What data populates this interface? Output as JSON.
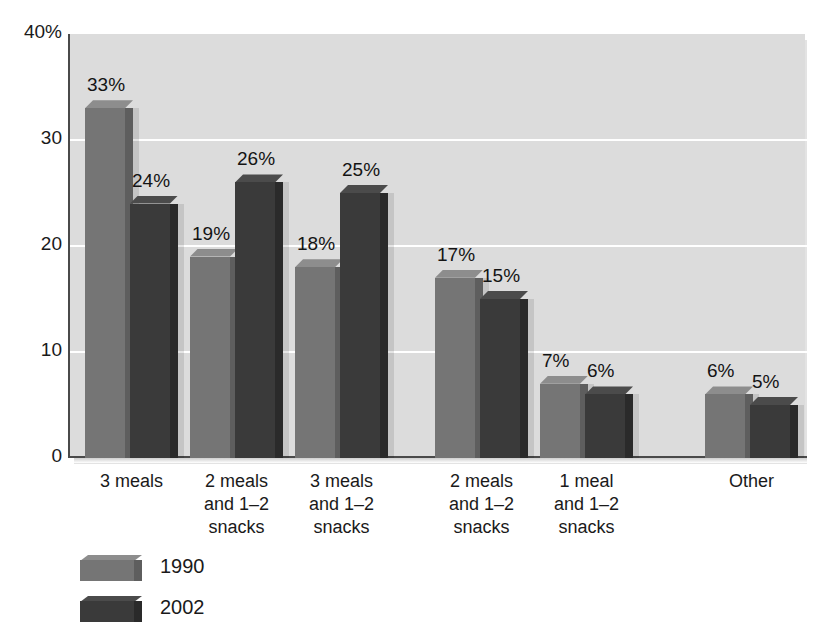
{
  "title_remnant": "",
  "chart_data": {
    "type": "bar",
    "title": "",
    "subtitle": "",
    "xlabel": "",
    "ylabel": "",
    "ylim": [
      0,
      40
    ],
    "grid": true,
    "grid_orientation": "horizontal",
    "legend_position": "bottom-left",
    "y_ticks": [
      "0",
      "10",
      "20",
      "30",
      "40%"
    ],
    "y_tick_values": [
      0,
      10,
      20,
      30,
      40
    ],
    "categories": [
      "3 meals",
      "2 meals\nand 1–2\nsnacks",
      "3 meals\nand 1–2\nsnacks",
      "2 meals\nand 1–2\nsnacks",
      "1 meal\nand 1–2\nsnacks",
      "Other"
    ],
    "category_lines": [
      [
        "3 meals"
      ],
      [
        "2 meals",
        "and 1–2",
        "snacks"
      ],
      [
        "3 meals",
        "and 1–2",
        "snacks"
      ],
      [
        "2 meals",
        "and 1–2",
        "snacks"
      ],
      [
        "1 meal",
        "and 1–2",
        "snacks"
      ],
      [
        "Other"
      ]
    ],
    "series": [
      {
        "name": "1990",
        "color": "#757575",
        "values": [
          33,
          19,
          18,
          17,
          7,
          6
        ],
        "labels": [
          "33%",
          "19%",
          "18%",
          "17%",
          "7%",
          "6%"
        ]
      },
      {
        "name": "2002",
        "color": "#3a3a3a",
        "values": [
          24,
          26,
          25,
          15,
          6,
          5
        ],
        "labels": [
          "24%",
          "26%",
          "25%",
          "15%",
          "6%",
          "5%"
        ]
      }
    ]
  },
  "legend": {
    "items": [
      {
        "label": "1990",
        "color": "#757575"
      },
      {
        "label": "2002",
        "color": "#3a3a3a"
      }
    ]
  },
  "style": {
    "plot_background": "#dcdcdc",
    "gridline_color": "#ffffff",
    "axis_color": "#4a4a4a",
    "text_color": "#1a1a1a"
  }
}
